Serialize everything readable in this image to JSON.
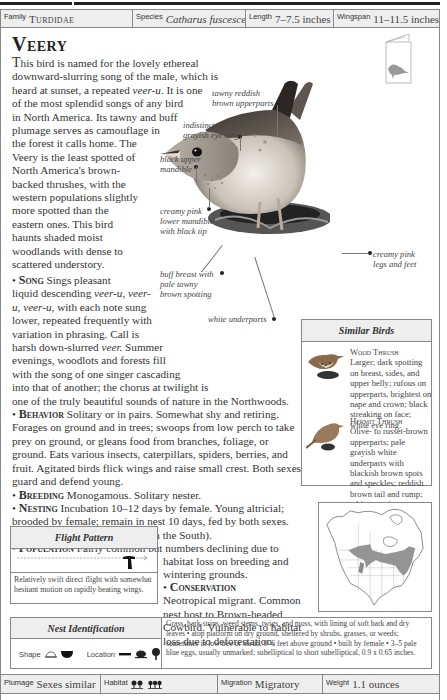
{
  "header": {
    "family_label": "Family",
    "family_value": "Turdidae",
    "species_label": "Species",
    "species_value": "Catharus fuscescens",
    "length_label": "Length",
    "length_value": "7–7.5 inches",
    "wingspan_label": "Wingspan",
    "wingspan_value": "11–11.5 inches"
  },
  "title": "Veery",
  "intro": {
    "lines": [
      "This bird is named for the lovely ethereal",
      "downward-slurring song of the male, which is",
      "heard at sunset, a repeated veer-u. It is one",
      "of the most splendid songs of any bird",
      "in North America. Its tawny and buff",
      "plumage serves as camouflage in",
      "the forest it calls home. The",
      "Veery is the least spotted of",
      "North America's brown-",
      "backed thrushes, with the",
      "western populations slightly",
      "more spotted than the",
      "eastern ones. This bird",
      "haunts shaded moist",
      "woodlands with dense to",
      "scattered understory."
    ]
  },
  "sections": {
    "song": {
      "heading": "Song",
      "lines": [
        "Sings pleasant",
        "liquid descending veer-u, veer-",
        "u, veer-u, with each note sung",
        "lower, repeated frequently with",
        "variation in phrasing. Call is",
        "harsh down-slurred veer. Summer",
        "evenings, woodlots and forests fill",
        "with the song of one singer cascading",
        "into that of another; the chorus at twilight is",
        "one of the truly beautiful sounds of nature in the Northwoods."
      ]
    },
    "behavior": {
      "heading": "Behavior",
      "lines": [
        "Solitary or in pairs. Somewhat shy and retiring.",
        "Forages on ground and in trees; swoops from low perch to take",
        "prey on ground, or gleans food from branches, foliage, or",
        "ground. Eats various insects, caterpillars, spiders, berries, and",
        "fruit. Agitated birds flick wings and raise small crest. Both sexes",
        "guard and defend young."
      ]
    },
    "breeding": {
      "heading": "Breeding",
      "text": "Monogamous. Solitary nester."
    },
    "nesting": {
      "heading": "Nesting",
      "lines": [
        "Incubation 10–12 days by female. Young altricial;",
        "brooded by female; remain in nest 10 days, fed by both sexes.",
        "1 brood per year (sometimes 2 in the South)."
      ]
    },
    "population": {
      "heading": "Population",
      "lines": [
        "Fairly common but numbers declining due to",
        "habitat loss on breeding and",
        "wintering grounds."
      ]
    },
    "conservation": {
      "heading": "Conservation",
      "lines": [
        "Neotropical migrant. Common",
        "nest host to Brown-headed",
        "Cowbird. Vulnerable to habitat",
        "loss due to deforestation."
      ]
    }
  },
  "callouts": {
    "upperparts": [
      "tawny reddish",
      "brown upperparts"
    ],
    "eye_ring": [
      "indistinct",
      "grayish eye ring"
    ],
    "upper_mandible": [
      "black upper",
      "mandible"
    ],
    "lower_mandible": [
      "creamy pink",
      "lower mandible",
      "with black tip"
    ],
    "breast": [
      "buff breast with",
      "pale tawny",
      "brown spotting"
    ],
    "underparts": [
      "white underparts"
    ],
    "legs": [
      "creamy pink",
      "legs and feet"
    ]
  },
  "similar_birds": {
    "heading": "Similar Birds",
    "items": [
      {
        "name": "Wood Thrush",
        "description": "Larger; dark spotting on breast, sides, and upper belly; rufous on upperparts, brightest on nape and crown; black streaking on face; white eye ring."
      },
      {
        "name": "Hermit Thrush",
        "description": "Olive- to russet-brown upperparts; pale grayish white underparts with blackish brown spots and speckles; reddish brown tail and rump; white eye ring."
      }
    ]
  },
  "flight_pattern": {
    "heading": "Flight Pattern",
    "description": "Relatively swift direct flight with somewhat hesitant motion on rapidly beating wings."
  },
  "nest_identification": {
    "heading": "Nest Identification",
    "shape_label": "Shape",
    "location_label": "Location",
    "description": "Grass, bark strips, weed stems, twigs, and moss, with lining of soft bark and dry leaves • atop platform on dry ground, sheltered by shrubs, grasses, or weeds; sometimes in low tree or shrub, 0–6 feet above ground • built by female • 3–5 pale blue eggs, usually unmarked; subelliptical to short subelliptical, 0.9 x 0.65 inches."
  },
  "footer": {
    "plumage_label": "Plumage",
    "plumage_value": "Sexes similar",
    "habitat_label": "Habitat",
    "habitat_icons": [
      "deciduous-forest-icon",
      "mixed-forest-icon"
    ],
    "migration_label": "Migration",
    "migration_value": "Migratory",
    "weight_label": "Weight",
    "weight_value": "1.1 ounces"
  },
  "colors": {
    "panel_bg": "#eeeeee",
    "border": "#888888",
    "range_fill": "#8a8a8a",
    "text": "#333333"
  }
}
